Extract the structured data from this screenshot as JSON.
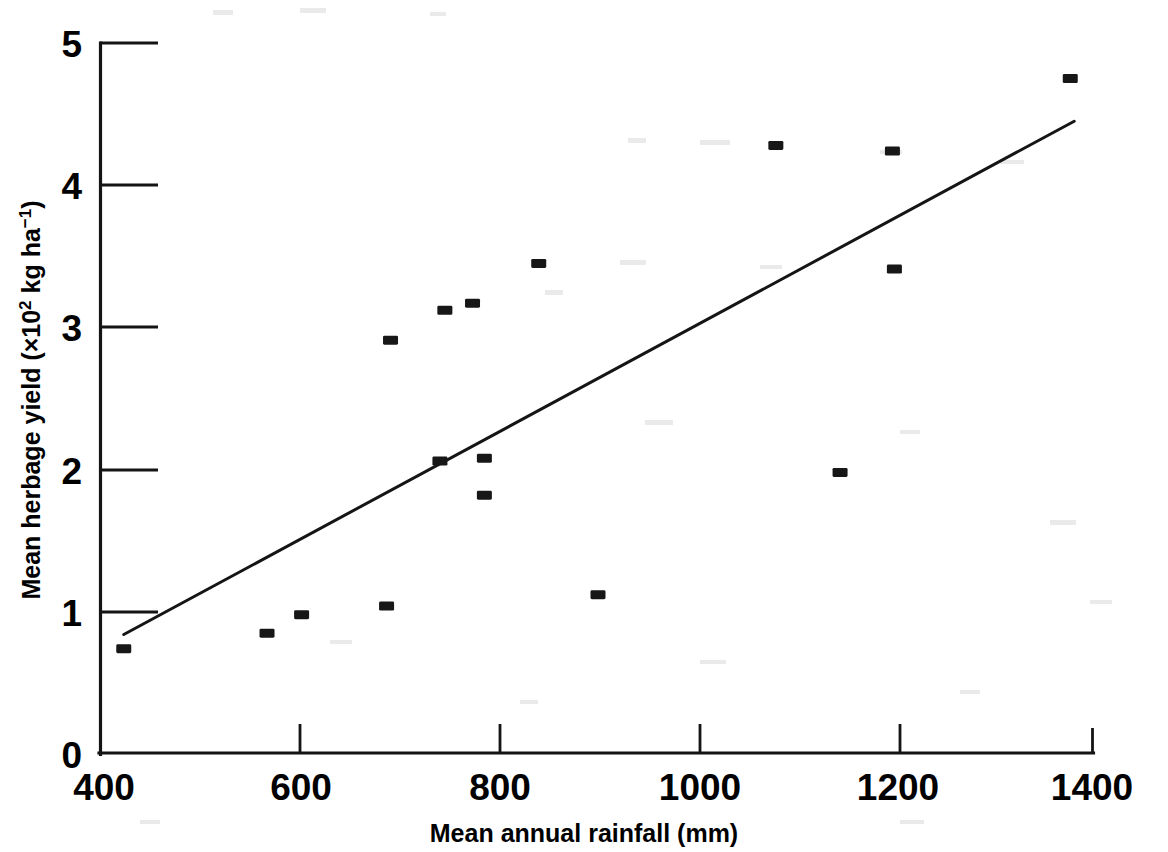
{
  "chart_data": {
    "type": "scatter",
    "title": "",
    "subtitle": "",
    "xlabel": "Mean annual rainfall (mm)",
    "ylabel": "Mean herbage yield (×10² kg ha⁻¹)",
    "ylabel_parts": {
      "lead": "Mean herbage yield (×10",
      "sup1": "2",
      "mid": " kg ha",
      "sup2": "−1",
      "tail": ")"
    },
    "xlim": [
      400,
      1400
    ],
    "ylim": [
      0,
      5
    ],
    "xticks": [
      400,
      600,
      800,
      1000,
      1200,
      1400
    ],
    "xtick_labels": [
      "400",
      "600",
      "800",
      "1000",
      "1200",
      "1400"
    ],
    "yticks": [
      0,
      1,
      2,
      3,
      4,
      5
    ],
    "ytick_labels": [
      "0",
      "1",
      "2",
      "3",
      "4",
      "5"
    ],
    "grid": false,
    "legend": null,
    "marker_style": "filled-square",
    "marker_color": "#171717",
    "line_color": "#151515",
    "axis_color": "#141414",
    "background_color": "#ffffff",
    "x": [
      420,
      565,
      600,
      686,
      690,
      740,
      745,
      773,
      785,
      785,
      840,
      900,
      1080,
      1145,
      1198,
      1200,
      1378
    ],
    "y": [
      0.74,
      0.85,
      0.98,
      1.04,
      2.91,
      2.06,
      3.12,
      3.17,
      2.08,
      1.82,
      3.45,
      1.12,
      4.28,
      1.98,
      4.24,
      3.41,
      4.75
    ],
    "points": [
      {
        "x": 420,
        "y": 0.74
      },
      {
        "x": 565,
        "y": 0.85
      },
      {
        "x": 600,
        "y": 0.98
      },
      {
        "x": 686,
        "y": 1.04
      },
      {
        "x": 690,
        "y": 2.91
      },
      {
        "x": 740,
        "y": 2.06
      },
      {
        "x": 745,
        "y": 3.12
      },
      {
        "x": 773,
        "y": 3.17
      },
      {
        "x": 785,
        "y": 2.08
      },
      {
        "x": 785,
        "y": 1.82
      },
      {
        "x": 840,
        "y": 3.45
      },
      {
        "x": 900,
        "y": 1.12
      },
      {
        "x": 1080,
        "y": 4.28
      },
      {
        "x": 1145,
        "y": 1.98
      },
      {
        "x": 1198,
        "y": 4.24
      },
      {
        "x": 1200,
        "y": 3.41
      },
      {
        "x": 1378,
        "y": 4.75
      }
    ],
    "series": [
      {
        "name": "observations",
        "type": "scatter",
        "x": [
          420,
          565,
          600,
          686,
          690,
          740,
          745,
          773,
          785,
          785,
          840,
          900,
          1080,
          1145,
          1198,
          1200,
          1378
        ],
        "values": [
          0.74,
          0.85,
          0.98,
          1.04,
          2.91,
          2.06,
          3.12,
          3.17,
          2.08,
          1.82,
          3.45,
          1.12,
          4.28,
          1.98,
          4.24,
          3.41,
          4.75
        ]
      },
      {
        "name": "regression-line",
        "type": "line",
        "x": [
          420,
          1382
        ],
        "values": [
          0.84,
          4.45
        ]
      }
    ],
    "trendline": {
      "x_start": 420,
      "y_start": 0.84,
      "x_end": 1382,
      "y_end": 4.45,
      "slope_per_mm": 0.00375,
      "intercept": -0.735
    }
  },
  "axes": {
    "x_title": "Mean annual rainfall (mm)",
    "y_title": "Mean herbage yield (×10² kg ha⁻¹)"
  }
}
